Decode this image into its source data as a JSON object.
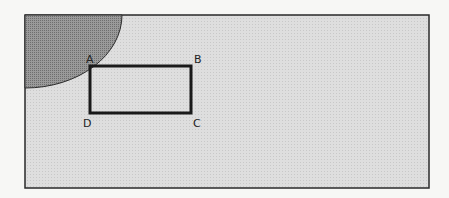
{
  "diagram": {
    "frame": {
      "x": 25,
      "y": 15,
      "width": 404,
      "height": 173,
      "fill": "#dcdcdc",
      "stroke": "#2a2a2a"
    },
    "quarter_circle": {
      "cx": 25,
      "cy": 15,
      "rx": 97,
      "ry": 73,
      "fill": "#8e8e8e"
    },
    "rectangle": {
      "x": 90,
      "y": 66,
      "width": 101,
      "height": 47,
      "stroke": "#1a1a1a",
      "stroke_width": 3
    },
    "labels": {
      "A": "A",
      "B": "B",
      "C": "C",
      "D": "D"
    }
  }
}
